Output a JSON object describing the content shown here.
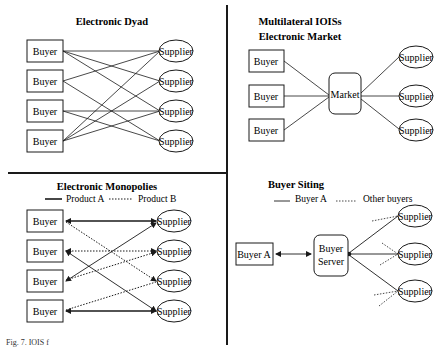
{
  "figure": {
    "caption": "Fig. 7. IOIS f",
    "colors": {
      "ink": "#1a1a1a",
      "background": "#ffffff"
    }
  },
  "panels": {
    "electronic_dyad": {
      "title": "Electronic Dyad",
      "buyers": [
        "Buyer",
        "Buyer",
        "Buyer",
        "Buyer"
      ],
      "suppliers": [
        "Supplier",
        "Supplier",
        "Supplier",
        "Supplier"
      ],
      "links": [
        [
          1,
          1
        ],
        [
          1,
          2
        ],
        [
          1,
          3
        ],
        [
          2,
          1
        ],
        [
          2,
          4
        ],
        [
          3,
          3
        ],
        [
          3,
          4
        ],
        [
          4,
          1
        ],
        [
          4,
          2
        ],
        [
          4,
          3
        ]
      ]
    },
    "multilateral": {
      "title": "Multilateral IOISs",
      "subtitle": "Electronic Market",
      "buyers": [
        "Buyer",
        "Buyer",
        "Buyer"
      ],
      "hub": "Market",
      "suppliers": [
        "Supplier",
        "Supplier",
        "Supplier"
      ]
    },
    "electronic_monopolies": {
      "title": "Electronic Monopolies",
      "legend": {
        "solid": "Product A",
        "dotted": "Product B"
      },
      "buyers": [
        "Buyer",
        "Buyer",
        "Buyer",
        "Buyer"
      ],
      "suppliers": [
        "Supplier",
        "Supplier",
        "Supplier",
        "Supplier"
      ],
      "product_a_links": [
        [
          1,
          1
        ],
        [
          2,
          4
        ],
        [
          3,
          1
        ],
        [
          4,
          4
        ]
      ],
      "product_b_links": [
        [
          1,
          3
        ],
        [
          2,
          2
        ],
        [
          3,
          2
        ],
        [
          4,
          3
        ]
      ]
    },
    "buyer_siting": {
      "title": "Buyer Siting",
      "legend": {
        "solid": "Buyer A",
        "dotted": "Other buyers"
      },
      "buyer": "Buyer A",
      "server_line1": "Buyer",
      "server_line2": "Server",
      "suppliers": [
        "Supplier",
        "Supplier",
        "Supplier"
      ]
    }
  }
}
